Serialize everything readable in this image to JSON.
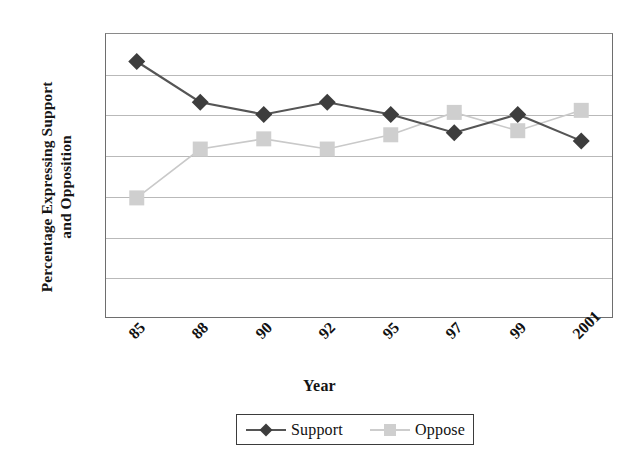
{
  "chart_data": {
    "type": "line",
    "title": "",
    "xlabel": "Year",
    "ylabel": "Percentage Expressing Support and Opposition",
    "categories": [
      "85",
      "88",
      "90",
      "92",
      "95",
      "97",
      "99",
      "2001"
    ],
    "series": [
      {
        "name": "Support",
        "values": [
          63,
          53,
          50,
          53,
          50,
          45.5,
          50,
          43.5
        ],
        "color": "#4a4a4a",
        "marker": "diamond"
      },
      {
        "name": "Oppose",
        "values": [
          29.5,
          41.5,
          44,
          41.5,
          45,
          50.5,
          46,
          51
        ],
        "color": "#bdbdbd",
        "marker": "square"
      }
    ],
    "ylim": [
      0,
      70
    ],
    "yticks": [
      0,
      10,
      20,
      30,
      40,
      50,
      60,
      70
    ],
    "grid": true,
    "legend_position": "bottom"
  },
  "axes": {
    "y_title": "Percentage Expressing Support\nand Opposition",
    "x_title": "Year",
    "y_tick_labels": [
      "70",
      "60",
      "50",
      "40",
      "30",
      "20",
      "10",
      "0"
    ],
    "x_tick_labels": [
      "85",
      "88",
      "90",
      "92",
      "95",
      "97",
      "99",
      "2001"
    ]
  },
  "legend": {
    "items": [
      {
        "label": "Support",
        "icon": "diamond-marker-icon",
        "color": "#4a4a4a"
      },
      {
        "label": "Oppose",
        "icon": "square-marker-icon",
        "color": "#c6c6c6"
      }
    ]
  },
  "colors": {
    "support_line": "#555555",
    "support_marker": "#3d3d3d",
    "oppose_line": "#c9c9c9",
    "oppose_marker": "#cfcfcf",
    "gridline": "#b9b9b9",
    "frame": "#6e6e6e",
    "text": "#111111",
    "background": "#ffffff"
  }
}
